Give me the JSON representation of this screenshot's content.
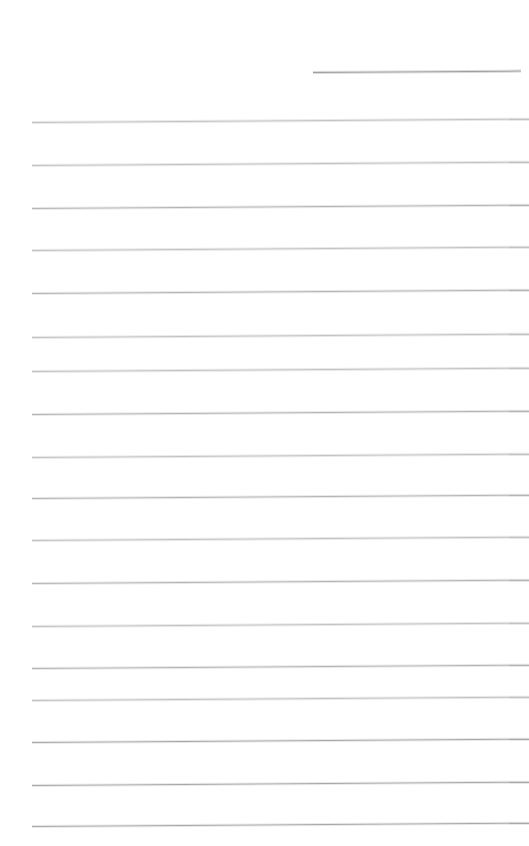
{
  "document": {
    "kind": "scanned-lined-paper",
    "page_label": "",
    "background_color": "#ffffff",
    "width_px": 529,
    "height_px": 846,
    "has_text_content": false,
    "visible_text": ""
  },
  "scan": {
    "skew_degrees": -0.38,
    "line_color": "#b5b5b5",
    "line_color_soft": "#c4c4c4",
    "line_color_strong": "#a8a8a8"
  },
  "header_rule": {
    "name": "header-rule",
    "x": 313,
    "y": 72,
    "width": 208,
    "color": "#9e9e9e",
    "thickness_px": 1
  },
  "ruled_lines": [
    {
      "index": 1,
      "x": 32,
      "y": 122,
      "width": 497,
      "weight": "soft"
    },
    {
      "index": 2,
      "x": 32,
      "y": 165,
      "width": 497,
      "weight": "soft"
    },
    {
      "index": 3,
      "x": 32,
      "y": 208,
      "width": 497,
      "weight": "normal"
    },
    {
      "index": 4,
      "x": 32,
      "y": 250,
      "width": 497,
      "weight": "soft"
    },
    {
      "index": 5,
      "x": 32,
      "y": 293,
      "width": 497,
      "weight": "normal"
    },
    {
      "index": 6,
      "x": 32,
      "y": 337,
      "width": 497,
      "weight": "soft"
    },
    {
      "index": 7,
      "x": 32,
      "y": 371,
      "width": 497,
      "weight": "soft"
    },
    {
      "index": 8,
      "x": 32,
      "y": 414,
      "width": 497,
      "weight": "normal"
    },
    {
      "index": 9,
      "x": 32,
      "y": 457,
      "width": 497,
      "weight": "soft"
    },
    {
      "index": 10,
      "x": 32,
      "y": 498,
      "width": 497,
      "weight": "normal"
    },
    {
      "index": 11,
      "x": 32,
      "y": 540,
      "width": 497,
      "weight": "soft"
    },
    {
      "index": 12,
      "x": 32,
      "y": 583,
      "width": 497,
      "weight": "normal"
    },
    {
      "index": 13,
      "x": 32,
      "y": 626,
      "width": 497,
      "weight": "soft"
    },
    {
      "index": 14,
      "x": 32,
      "y": 668,
      "width": 497,
      "weight": "normal"
    },
    {
      "index": 15,
      "x": 32,
      "y": 700,
      "width": 497,
      "weight": "soft"
    },
    {
      "index": 16,
      "x": 32,
      "y": 742,
      "width": 497,
      "weight": "strong"
    },
    {
      "index": 17,
      "x": 32,
      "y": 785,
      "width": 497,
      "weight": "strong"
    },
    {
      "index": 18,
      "x": 32,
      "y": 826,
      "width": 497,
      "weight": "strong"
    }
  ]
}
